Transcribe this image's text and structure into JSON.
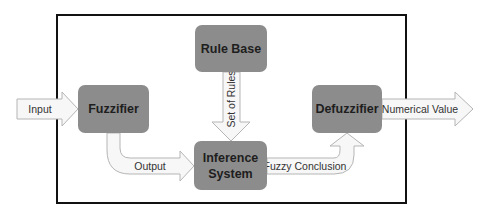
{
  "diagram": {
    "type": "fuzzy-logic-system-block-diagram",
    "colors": {
      "box_fill": "#8c8c8c",
      "arrow_fill": "#f7f7f7",
      "arrow_stroke": "#b5b5b5",
      "frame_stroke": "#111111"
    },
    "boxes": {
      "rule_base": "Rule Base",
      "fuzzifier": "Fuzzifier",
      "inference_line1": "Inference",
      "inference_line2": "System",
      "defuzzifier": "Defuzzifier"
    },
    "arrows": {
      "input": "Input",
      "set_of_rules": "Set of Rules",
      "output": "Output",
      "fuzzy_conclusion": "Fuzzy Conclusion",
      "numerical_value": "Numerical Value"
    },
    "connections": [
      {
        "from": "external",
        "to": "Fuzzifier",
        "label": "Input"
      },
      {
        "from": "Rule Base",
        "to": "Inference System",
        "label": "Set of Rules"
      },
      {
        "from": "Fuzzifier",
        "to": "Inference System",
        "label": "Output"
      },
      {
        "from": "Inference System",
        "to": "Defuzzifier",
        "label": "Fuzzy Conclusion"
      },
      {
        "from": "Defuzzifier",
        "to": "external",
        "label": "Numerical Value"
      }
    ]
  }
}
